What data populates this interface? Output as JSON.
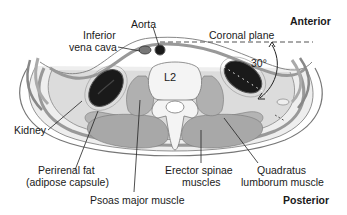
{
  "figure": {
    "type": "anatomical-cross-section",
    "vertebra_label": "L2",
    "angle_label": "30°",
    "orientation": {
      "top": "Anterior",
      "bottom": "Posterior"
    },
    "labels": {
      "aorta": "Aorta",
      "ivc_line1": "Inferior",
      "ivc_line2": "vena cava",
      "coronal_plane": "Coronal plane",
      "kidney": "Kidney",
      "perirenal_line1": "Perirenal fat",
      "perirenal_line2": "(adipose capsule)",
      "psoas": "Psoas major muscle",
      "erector_line1": "Erector spinae",
      "erector_line2": "muscles",
      "quadratus_line1": "Quadratus",
      "quadratus_line2": "lumborum muscle"
    },
    "colors": {
      "outline": "#555555",
      "skin_fill": "#eeeeee",
      "muscle_fill": "#a8a8a8",
      "muscle_light": "#c4c4c4",
      "kidney_fill": "#1a1a1a",
      "bone_fill": "#f4f4f4",
      "fat_fill": "#dcdcdc",
      "text": "#1a1a1a"
    }
  }
}
